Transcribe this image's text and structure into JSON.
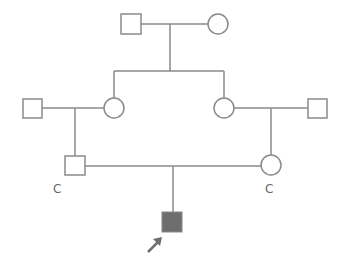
{
  "diagram": {
    "type": "pedigree",
    "colors": {
      "line": "#8a8a8a",
      "affected_fill": "#6e6e6e",
      "arrow": "#6e6e6e"
    },
    "generations": [
      {
        "id": "I",
        "individuals": [
          {
            "id": "I-1",
            "sex": "male",
            "affected": false
          },
          {
            "id": "I-2",
            "sex": "female",
            "affected": false
          }
        ]
      },
      {
        "id": "II",
        "individuals": [
          {
            "id": "II-1",
            "sex": "male",
            "affected": false,
            "note": "married in"
          },
          {
            "id": "II-2",
            "sex": "female",
            "affected": false,
            "note": "daughter of I-1 x I-2"
          },
          {
            "id": "II-3",
            "sex": "female",
            "affected": false,
            "note": "daughter of I-1 x I-2"
          },
          {
            "id": "II-4",
            "sex": "male",
            "affected": false,
            "note": "married in"
          }
        ]
      },
      {
        "id": "III",
        "individuals": [
          {
            "id": "III-1",
            "sex": "male",
            "affected": false,
            "label": "C"
          },
          {
            "id": "III-2",
            "sex": "female",
            "affected": false,
            "label": "C"
          }
        ]
      },
      {
        "id": "IV",
        "individuals": [
          {
            "id": "IV-1",
            "sex": "male",
            "affected": true,
            "proband": true
          }
        ]
      }
    ],
    "labels": {
      "carrier_left": "C",
      "carrier_right": "C"
    }
  }
}
